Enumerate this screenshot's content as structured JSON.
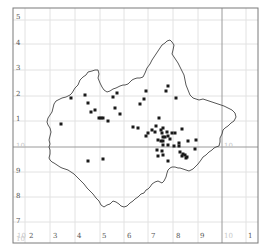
{
  "map": {
    "type": "grid distribution map",
    "colors": {
      "background": "#ffffff",
      "frame": "#7a7a7a",
      "grid_minor": "#e2e2e2",
      "grid_major": "#9a9a9a",
      "boundary": "#444444",
      "dot": "#1a1a1a"
    },
    "x_axis_labels": [
      {
        "text": "10",
        "x": 17,
        "faint": true
      },
      {
        "text": "2",
        "x": 29,
        "faint": false
      },
      {
        "text": "3",
        "x": 53,
        "faint": false
      },
      {
        "text": "4",
        "x": 77,
        "faint": false
      },
      {
        "text": "5",
        "x": 102,
        "faint": false
      },
      {
        "text": "6",
        "x": 127,
        "faint": false
      },
      {
        "text": "7",
        "x": 151,
        "faint": false
      },
      {
        "text": "8",
        "x": 176,
        "faint": false
      },
      {
        "text": "9",
        "x": 200,
        "faint": false
      },
      {
        "text": "10",
        "x": 224,
        "faint": true
      },
      {
        "text": "1",
        "x": 248,
        "faint": false
      }
    ],
    "y_axis_labels": [
      {
        "text": "5",
        "y": 14,
        "faint": false
      },
      {
        "text": "4",
        "y": 40,
        "faint": false
      },
      {
        "text": "3",
        "y": 65,
        "faint": false
      },
      {
        "text": "2",
        "y": 91,
        "faint": false
      },
      {
        "text": "1",
        "y": 116,
        "faint": false
      },
      {
        "text": "10",
        "y": 143,
        "faint": true
      },
      {
        "text": "9",
        "y": 168,
        "faint": false
      },
      {
        "text": "8",
        "y": 193,
        "faint": false
      },
      {
        "text": "7",
        "y": 218,
        "faint": false
      },
      {
        "text": "10",
        "y": 236,
        "faint": true
      }
    ],
    "inner_labels": [
      {
        "text": "10",
        "x": 224,
        "y": 143,
        "faint": true
      }
    ],
    "grid": {
      "frame": {
        "x": 13,
        "y": 8,
        "w": 245,
        "h": 235
      },
      "vertical_minor": [
        25,
        50,
        75,
        100,
        124,
        148,
        173,
        198,
        246
      ],
      "horizontal_minor": [
        20,
        44,
        70,
        96,
        121,
        172,
        197,
        222
      ],
      "vertical_major": [
        222
      ],
      "horizontal_major": [
        147
      ]
    },
    "boundary_points": "58,100 62,98 66,97 70,95 72,93 75,88 78,85 80,80 83,77 86,75 88,72 92,71 95,70 98,70 99,74 98,78 100,83 102,87 104,90 107,92 110,91 113,89 116,88 120,86 123,85 125,85 128,84 130,82 132,80 134,79 137,78 140,78 143,77 145,73 147,68 150,64 152,60 154,57 156,54 158,51 160,48 162,45 165,43 167,41 170,40 172,42 174,45 173,50 172,54 174,57 176,60 178,63 180,67 182,71 184,75 185,80 186,85 188,90 190,95 193,98 196,99 199,100 203,99 206,100 209,101 212,102 215,103 218,104 221,105 224,106 228,108 232,110 235,113 236,117 234,121 231,123 228,126 225,128 223,130 222,134 220,138 220,142 219,146 216,147 214,148 212,150 209,152 206,155 203,157 201,160 198,164 195,167 193,169 191,170 189,171 186,170 183,169 180,168 178,168 175,167 172,167 170,168 168,170 167,173 166,177 164,181 162,183 160,182 158,181 155,182 152,184 150,187 148,189 146,190 144,193 141,194 138,197 135,199 133,201 130,203 127,206 124,207 121,206 119,204 116,202 113,201 110,204 107,205 104,207 101,205 99,201 96,198 93,194 90,191 87,188 84,184 80,180 77,177 74,174 71,172 68,170 65,169 62,168 60,167 57,165 54,163 52,162 50,160 49,158 50,154 50,150 49,147 50,144 49,140 50,136 51,132 50,128 48,125 47,122 48,118 50,115 52,112 53,108 54,104 56,101 58,100",
    "dots": [
      {
        "x": 71,
        "y": 98
      },
      {
        "x": 85,
        "y": 95
      },
      {
        "x": 88,
        "y": 103
      },
      {
        "x": 91,
        "y": 112
      },
      {
        "x": 95,
        "y": 110
      },
      {
        "x": 99,
        "y": 118
      },
      {
        "x": 101,
        "y": 118
      },
      {
        "x": 103,
        "y": 118
      },
      {
        "x": 108,
        "y": 121
      },
      {
        "x": 113,
        "y": 97
      },
      {
        "x": 117,
        "y": 93
      },
      {
        "x": 115,
        "y": 108
      },
      {
        "x": 120,
        "y": 114
      },
      {
        "x": 133,
        "y": 127
      },
      {
        "x": 138,
        "y": 128
      },
      {
        "x": 144,
        "y": 99
      },
      {
        "x": 140,
        "y": 104
      },
      {
        "x": 146,
        "y": 91
      },
      {
        "x": 159,
        "y": 118
      },
      {
        "x": 176,
        "y": 98
      },
      {
        "x": 168,
        "y": 86
      },
      {
        "x": 166,
        "y": 91
      },
      {
        "x": 155,
        "y": 132
      },
      {
        "x": 146,
        "y": 136
      },
      {
        "x": 148,
        "y": 133
      },
      {
        "x": 152,
        "y": 130
      },
      {
        "x": 156,
        "y": 126
      },
      {
        "x": 161,
        "y": 130
      },
      {
        "x": 163,
        "y": 128
      },
      {
        "x": 162,
        "y": 133
      },
      {
        "x": 163,
        "y": 137
      },
      {
        "x": 165,
        "y": 137
      },
      {
        "x": 167,
        "y": 132
      },
      {
        "x": 168,
        "y": 136
      },
      {
        "x": 170,
        "y": 139
      },
      {
        "x": 172,
        "y": 133
      },
      {
        "x": 175,
        "y": 133
      },
      {
        "x": 179,
        "y": 143
      },
      {
        "x": 182,
        "y": 129
      },
      {
        "x": 188,
        "y": 141
      },
      {
        "x": 196,
        "y": 140
      },
      {
        "x": 158,
        "y": 140
      },
      {
        "x": 161,
        "y": 141
      },
      {
        "x": 163,
        "y": 141
      },
      {
        "x": 163,
        "y": 145
      },
      {
        "x": 168,
        "y": 145
      },
      {
        "x": 174,
        "y": 146
      },
      {
        "x": 179,
        "y": 146
      },
      {
        "x": 157,
        "y": 150
      },
      {
        "x": 158,
        "y": 156
      },
      {
        "x": 162,
        "y": 151
      },
      {
        "x": 163,
        "y": 155
      },
      {
        "x": 168,
        "y": 161
      },
      {
        "x": 180,
        "y": 152
      },
      {
        "x": 182,
        "y": 156
      },
      {
        "x": 183,
        "y": 154
      },
      {
        "x": 186,
        "y": 158
      },
      {
        "x": 195,
        "y": 149
      },
      {
        "x": 88,
        "y": 161
      },
      {
        "x": 103,
        "y": 159
      },
      {
        "x": 61,
        "y": 124
      },
      {
        "x": 187,
        "y": 157
      },
      {
        "x": 185,
        "y": 155
      }
    ]
  }
}
